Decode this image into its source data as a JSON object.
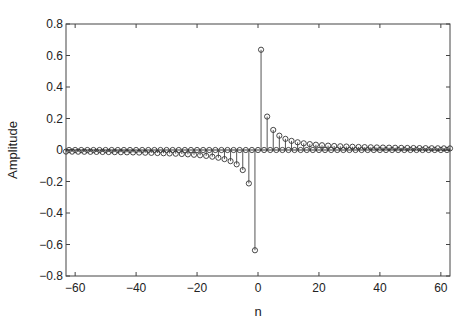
{
  "chart_data": {
    "type": "stem",
    "title": "",
    "xlabel": "n",
    "ylabel": "Amplitude",
    "xlim": [
      -63,
      63
    ],
    "ylim": [
      -0.8,
      0.8
    ],
    "xticks": [
      -60,
      -40,
      -20,
      0,
      20,
      40,
      60
    ],
    "xtick_labels": [
      "−60",
      "−40",
      "−20",
      "0",
      "20",
      "40",
      "60"
    ],
    "yticks": [
      0.8,
      0.6,
      0.4,
      0.2,
      0,
      -0.2,
      -0.4,
      -0.6,
      -0.8
    ],
    "ytick_labels": [
      "0.8",
      "0.6",
      "0.4",
      "0.2",
      "0",
      "−0.2",
      "−0.4",
      "−0.6",
      "−0.8"
    ],
    "grid": false,
    "legend": null,
    "marker": "circle-open",
    "x_start": -63,
    "x_end": 63,
    "key_values": {
      "n=-5": -0.127,
      "n=-3": -0.212,
      "n=-1": -0.637,
      "n=0": 0,
      "n=1": 0.637,
      "n=3": 0.212,
      "n=5": 0.127,
      "n=7": 0.091,
      "n=9": 0.071
    },
    "colors": {
      "stem": "#555555",
      "axis": "#444444",
      "baseline": "#333333"
    }
  },
  "axes": {
    "xlabel": "n",
    "ylabel": "Amplitude"
  }
}
